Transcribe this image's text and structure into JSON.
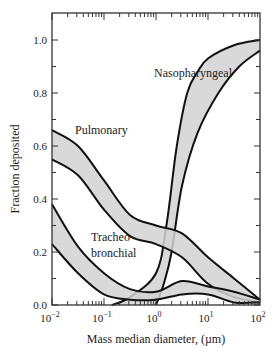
{
  "chart_data": {
    "type": "area",
    "title": "",
    "xlabel": "Mass median diameter, (µm)",
    "ylabel": "Fraction deposited",
    "xscale": "log",
    "xlim": [
      0.01,
      100
    ],
    "ylim": [
      0.0,
      1.08
    ],
    "x_ticks": [
      {
        "v": -2,
        "label": "10",
        "exp": "−2"
      },
      {
        "v": -1,
        "label": "10",
        "exp": "−1"
      },
      {
        "v": 0,
        "label": "10",
        "exp": "0"
      },
      {
        "v": 1,
        "label": "10",
        "exp": "1"
      },
      {
        "v": 2,
        "label": "10",
        "exp": "2"
      }
    ],
    "y_ticks": [
      "0.0",
      "0.2",
      "0.4",
      "0.6",
      "0.8",
      "1.0"
    ],
    "grid": false,
    "legend": "none (inline labels)",
    "series": [
      {
        "name": "Nasopharyngeal",
        "kind": "band",
        "upper_log10x": [
          -0.85,
          -0.5,
          0.0,
          0.2,
          0.4,
          0.6,
          0.8,
          1.0,
          1.5,
          2.0
        ],
        "upper": [
          0.0,
          0.03,
          0.12,
          0.3,
          0.6,
          0.8,
          0.88,
          0.93,
          0.98,
          1.0
        ],
        "lower_log10x": [
          0.0,
          0.15,
          0.3,
          0.5,
          0.8,
          1.2,
          1.6,
          2.0
        ],
        "lower": [
          0.0,
          0.08,
          0.2,
          0.45,
          0.65,
          0.8,
          0.9,
          0.96
        ]
      },
      {
        "name": "Pulmonary",
        "kind": "band",
        "log10x": [
          -2.0,
          -1.5,
          -1.0,
          -0.5,
          0.0,
          0.5,
          1.0,
          1.5,
          2.0
        ],
        "upper": [
          0.66,
          0.6,
          0.47,
          0.34,
          0.3,
          0.27,
          0.18,
          0.1,
          0.02
        ],
        "lower": [
          0.55,
          0.49,
          0.36,
          0.26,
          0.23,
          0.18,
          0.08,
          0.03,
          0.01
        ]
      },
      {
        "name": "Tracheo-bronchial",
        "kind": "band",
        "log10x": [
          -2.0,
          -1.5,
          -1.0,
          -0.5,
          0.0,
          0.5,
          1.0,
          1.5,
          2.0
        ],
        "upper": [
          0.38,
          0.22,
          0.12,
          0.06,
          0.05,
          0.09,
          0.07,
          0.05,
          0.02
        ],
        "lower": [
          0.23,
          0.12,
          0.04,
          0.02,
          0.02,
          0.04,
          0.04,
          0.01,
          0.01
        ]
      }
    ],
    "annotations": [
      {
        "text": "Nasopharyngeal",
        "near_log10x": 0.3,
        "near_y": 0.95
      },
      {
        "text": "Pulmonary",
        "near_log10x": -1.4,
        "near_y": 0.63
      },
      {
        "text": "Tracheo-",
        "near_log10x": -0.9,
        "near_y": 0.22
      },
      {
        "text": "bronchial",
        "near_log10x": -0.9,
        "near_y": 0.16
      }
    ],
    "colors": {
      "band_fill": "#d2d2d2",
      "line": "#111111",
      "axis": "#333333"
    }
  }
}
